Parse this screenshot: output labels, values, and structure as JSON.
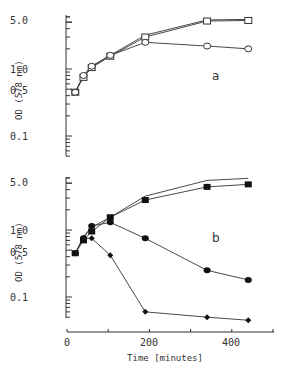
{
  "chart_data": [
    {
      "type": "line",
      "panel_label": "a",
      "ylabel": "OD (578 nm)",
      "xlabel": "",
      "yscale": "log",
      "ylim": [
        0.04,
        6
      ],
      "xlim": [
        0,
        500
      ],
      "ytick_labels": [
        "5.0",
        "1.0",
        "0.5",
        "0.1"
      ],
      "ytick_values": [
        5.0,
        1.0,
        0.5,
        0.1
      ],
      "x": [
        20,
        40,
        60,
        105,
        190,
        340,
        440
      ],
      "series": [
        {
          "name": "open squares",
          "marker": "open-square",
          "values": [
            0.45,
            0.75,
            1.05,
            1.55,
            3.0,
            5.2,
            5.3
          ]
        },
        {
          "name": "line only",
          "marker": "none",
          "values": [
            0.45,
            0.8,
            1.1,
            1.6,
            3.2,
            5.4,
            5.5
          ]
        },
        {
          "name": "open circles",
          "marker": "open-circle",
          "values": [
            0.45,
            0.8,
            1.1,
            1.6,
            2.5,
            2.2,
            2.0
          ]
        }
      ],
      "grid": false
    },
    {
      "type": "line",
      "panel_label": "b",
      "ylabel": "OD (578 nm)",
      "xlabel": "Time [minutes]",
      "yscale": "log",
      "ylim": [
        0.04,
        6
      ],
      "xlim": [
        0,
        500
      ],
      "ytick_labels": [
        "5.0",
        "1.0",
        "0.5",
        "0.1"
      ],
      "ytick_values": [
        5.0,
        1.0,
        0.5,
        0.1
      ],
      "xtick_labels": [
        "0",
        "200",
        "400"
      ],
      "xtick_values": [
        0,
        200,
        400
      ],
      "x": [
        20,
        40,
        60,
        105,
        190,
        340,
        440
      ],
      "series": [
        {
          "name": "line only",
          "marker": "none",
          "values": [
            0.45,
            0.8,
            1.1,
            1.55,
            3.2,
            5.5,
            5.9
          ]
        },
        {
          "name": "filled squares",
          "marker": "filled-square",
          "values": [
            0.45,
            0.7,
            0.95,
            1.55,
            2.8,
            4.4,
            4.8
          ]
        },
        {
          "name": "filled circles",
          "marker": "filled-circle",
          "values": [
            0.45,
            0.75,
            1.15,
            1.3,
            0.75,
            0.25,
            0.18
          ]
        },
        {
          "name": "filled diamonds",
          "marker": "filled-diamond",
          "x": [
            40,
            60,
            105,
            190,
            340,
            440
          ],
          "values": [
            0.75,
            0.75,
            0.42,
            0.06,
            0.05,
            0.045
          ]
        }
      ],
      "grid": false
    }
  ],
  "labels": {
    "ylabel": "OD (578 nm)",
    "xlabel": "Time [minutes]",
    "panel_a": "a",
    "panel_b": "b"
  }
}
